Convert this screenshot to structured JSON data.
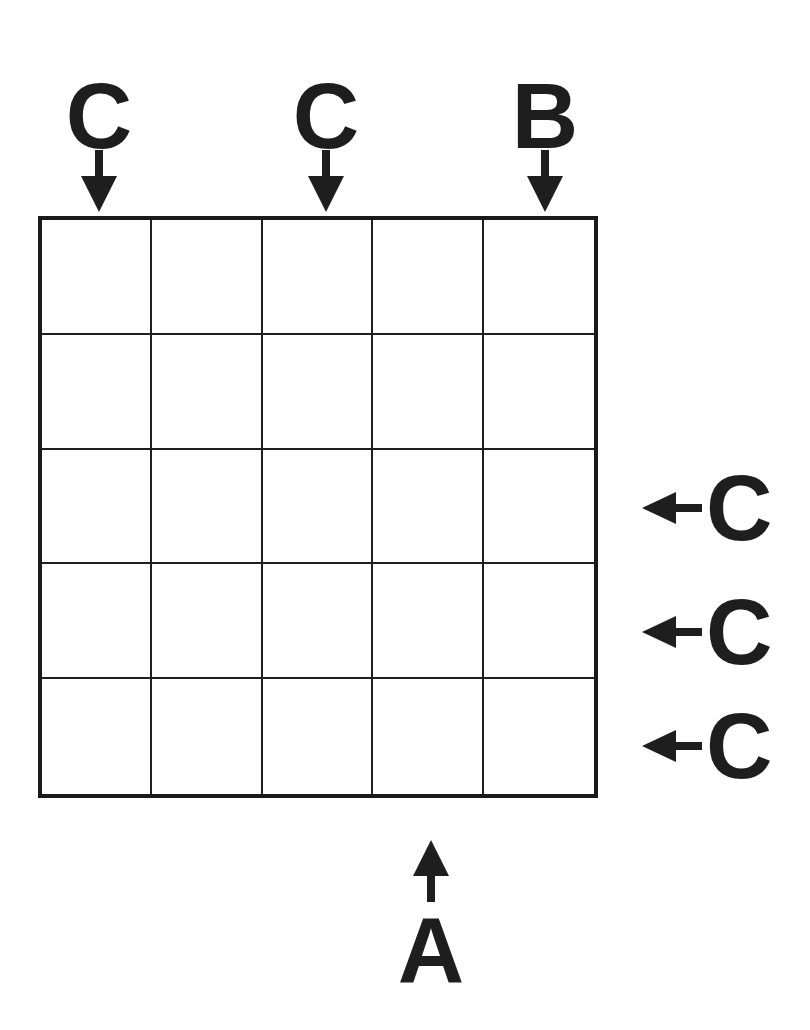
{
  "puzzle": {
    "type": "skyscraper-letter-placement",
    "grid_size": {
      "rows": 5,
      "cols": 5
    },
    "cells": [
      [
        "",
        "",
        "",
        "",
        ""
      ],
      [
        "",
        "",
        "",
        "",
        ""
      ],
      [
        "",
        "",
        "",
        "",
        ""
      ],
      [
        "",
        "",
        "",
        "",
        ""
      ],
      [
        "",
        "",
        "",
        "",
        ""
      ]
    ],
    "clues": {
      "top": [
        {
          "col": 1,
          "letter": "C",
          "arrow": "down"
        },
        {
          "col": 3,
          "letter": "C",
          "arrow": "down"
        },
        {
          "col": 5,
          "letter": "B",
          "arrow": "down"
        }
      ],
      "right": [
        {
          "row": 3,
          "letter": "C",
          "arrow": "left"
        },
        {
          "row": 4,
          "letter": "C",
          "arrow": "left"
        },
        {
          "row": 5,
          "letter": "C",
          "arrow": "left"
        }
      ],
      "bottom": [
        {
          "col": 4,
          "letter": "A",
          "arrow": "up"
        }
      ]
    },
    "colors": {
      "ink": "#1e1e1e",
      "background": "#ffffff"
    }
  }
}
